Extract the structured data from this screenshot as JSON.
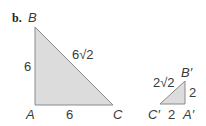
{
  "part_label": "b.",
  "colors": {
    "fill": "#dcdcdc",
    "stroke": "#8a8a8a",
    "text": "#3a3a3a"
  },
  "large_triangle": {
    "vertices": {
      "B": "B",
      "A": "A",
      "C": "C"
    },
    "sides": {
      "AB": "6",
      "AC": "6",
      "BC": "6√2"
    }
  },
  "small_triangle": {
    "vertices": {
      "B": "B′",
      "A": "A′",
      "C": "C′"
    },
    "sides": {
      "A_B": "2",
      "C_A": "2",
      "C_B": "2√2"
    }
  }
}
